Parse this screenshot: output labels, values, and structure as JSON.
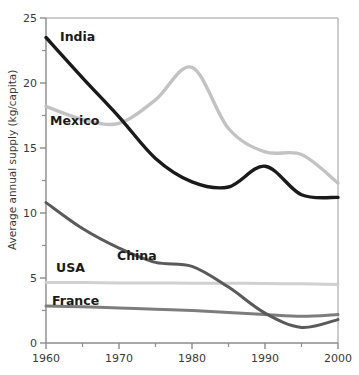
{
  "chart_data": {
    "type": "line",
    "title": "",
    "xlabel": "",
    "ylabel": "Average annual supply (kg/capita)",
    "xlim": [
      1960,
      2000
    ],
    "ylim": [
      0,
      25
    ],
    "x_ticks": [
      1960,
      1970,
      1980,
      1990,
      2000
    ],
    "x_minor_ticks": [
      1965,
      1975,
      1985,
      1995
    ],
    "y_ticks": [
      0,
      5,
      10,
      15,
      20,
      25
    ],
    "y_minor_ticks": [
      2.5,
      7.5,
      12.5,
      17.5,
      22.5
    ],
    "grid": false,
    "legend_position": "inline-labels",
    "x": [
      1960,
      1965,
      1970,
      1975,
      1980,
      1985,
      1990,
      1995,
      2000
    ],
    "series": [
      {
        "name": "India",
        "color": "#1a1a1a",
        "width": 3.4,
        "values": [
          23.5,
          20.4,
          17.4,
          14.2,
          12.4,
          12.0,
          13.6,
          11.4,
          11.2
        ],
        "label": "India",
        "label_x": 60,
        "label_y": 41
      },
      {
        "name": "Mexico",
        "color": "#c3c3c3",
        "width": 3.4,
        "values": [
          18.2,
          17.2,
          16.9,
          18.7,
          21.2,
          16.5,
          14.7,
          14.5,
          12.3
        ],
        "label": "Mexico",
        "label_x": 50,
        "label_y": 125
      },
      {
        "name": "China",
        "color": "#5a5a5a",
        "width": 3.0,
        "values": [
          10.8,
          8.8,
          7.3,
          6.2,
          5.9,
          4.3,
          2.3,
          1.2,
          1.8
        ],
        "label": "China",
        "label_x": 117,
        "label_y": 260
      },
      {
        "name": "USA",
        "color": "#d0d0d0",
        "width": 3.0,
        "values": [
          4.65,
          4.65,
          4.62,
          4.62,
          4.6,
          4.6,
          4.58,
          4.55,
          4.5
        ],
        "label": "USA",
        "label_x": 56,
        "label_y": 272
      },
      {
        "name": "France",
        "color": "#7d7d7d",
        "width": 3.0,
        "values": [
          2.85,
          2.78,
          2.7,
          2.6,
          2.5,
          2.35,
          2.2,
          2.05,
          2.2
        ],
        "label": "France",
        "label_x": 52,
        "label_y": 305
      }
    ],
    "x_tick_labels": [
      "1960",
      "1970",
      "1980",
      "1990",
      "2000"
    ],
    "y_tick_labels": [
      "0",
      "5",
      "10",
      "15",
      "20",
      "25"
    ]
  },
  "axis": {
    "frame_color": "#8c8c8c",
    "tick_color": "#8c8c8c"
  }
}
